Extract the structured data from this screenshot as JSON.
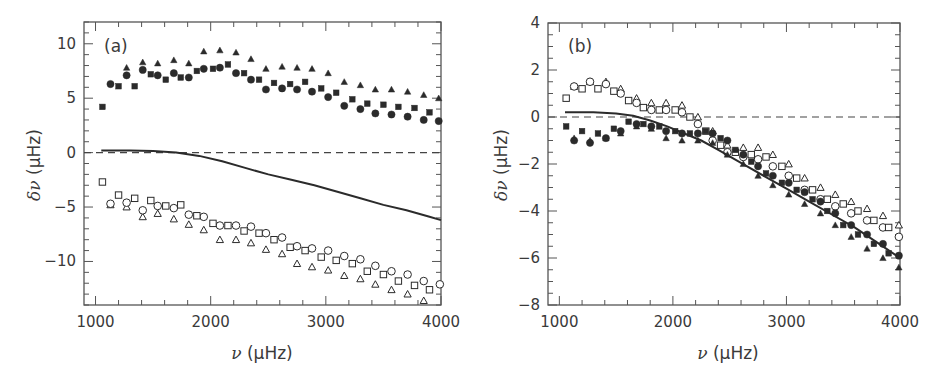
{
  "chart_data": [
    {
      "panel": "(a)",
      "type": "scatter",
      "xlabel": "ν (μHz)",
      "ylabel": "δν (μHz)",
      "xlim": [
        900,
        4000
      ],
      "ylim": [
        -14,
        12
      ],
      "xticks": [
        1000,
        2000,
        3000,
        4000
      ],
      "yticks": [
        -10,
        -5,
        0,
        5,
        10
      ],
      "grid": false,
      "reference_line": {
        "y": 0,
        "style": "dashed"
      },
      "series": [
        {
          "name": "filled triangles",
          "marker": "triangle-filled",
          "x": [
            1270,
            1410,
            1540,
            1680,
            1810,
            1940,
            2080,
            2220,
            2350,
            2480,
            2620,
            2750,
            2880,
            3020,
            3160,
            3300,
            3430,
            3570,
            3710,
            3850,
            3980
          ],
          "y": [
            7.8,
            8.3,
            8.2,
            8.5,
            8.2,
            9.3,
            9.4,
            9.2,
            8.6,
            7.7,
            7.9,
            7.8,
            7.7,
            7.3,
            6.5,
            6.2,
            5.8,
            5.8,
            5.6,
            5.3,
            5.0
          ]
        },
        {
          "name": "filled circles",
          "marker": "circle-filled",
          "x": [
            1130,
            1270,
            1410,
            1540,
            1680,
            1810,
            1940,
            2080,
            2220,
            2350,
            2480,
            2620,
            2750,
            2880,
            3020,
            3160,
            3300,
            3430,
            3570,
            3710,
            3850,
            3980
          ],
          "y": [
            6.3,
            7.1,
            7.6,
            7.1,
            7.3,
            6.9,
            7.7,
            7.8,
            7.3,
            6.7,
            5.8,
            5.9,
            5.8,
            5.6,
            5.1,
            4.3,
            4.0,
            3.6,
            3.5,
            3.3,
            3.0,
            2.9
          ]
        },
        {
          "name": "filled squares",
          "marker": "square-filled",
          "x": [
            1060,
            1200,
            1340,
            1480,
            1610,
            1740,
            1880,
            2020,
            2150,
            2290,
            2420,
            2550,
            2690,
            2820,
            2960,
            3090,
            3230,
            3360,
            3500,
            3630,
            3770,
            3900
          ],
          "y": [
            4.2,
            6.1,
            6.1,
            7.2,
            6.7,
            6.9,
            7.5,
            7.7,
            8.1,
            7.3,
            6.7,
            6.4,
            6.3,
            6.5,
            5.9,
            5.5,
            4.9,
            4.5,
            4.4,
            4.2,
            4.1,
            3.7
          ]
        },
        {
          "name": "open triangles",
          "marker": "triangle-open",
          "x": [
            1130,
            1270,
            1410,
            1540,
            1680,
            1810,
            1940,
            2080,
            2220,
            2350,
            2480,
            2620,
            2750,
            2880,
            3020,
            3160,
            3300,
            3430,
            3570,
            3710,
            3850
          ],
          "y": [
            -4.8,
            -5.0,
            -5.9,
            -5.6,
            -6.1,
            -6.6,
            -7.1,
            -8.0,
            -8.0,
            -8.3,
            -8.9,
            -9.3,
            -10.2,
            -10.5,
            -10.8,
            -11.3,
            -11.6,
            -12.1,
            -12.6,
            -13.0,
            -13.6
          ]
        },
        {
          "name": "open circles",
          "marker": "circle-open",
          "x": [
            1130,
            1270,
            1410,
            1540,
            1680,
            1810,
            1940,
            2080,
            2220,
            2350,
            2480,
            2620,
            2750,
            2880,
            3020,
            3160,
            3300,
            3430,
            3570,
            3710,
            3850,
            3990
          ],
          "y": [
            -4.7,
            -4.6,
            -5.3,
            -4.9,
            -5.1,
            -5.7,
            -5.9,
            -6.7,
            -6.7,
            -6.8,
            -7.4,
            -7.8,
            -8.6,
            -8.8,
            -9.0,
            -9.5,
            -9.8,
            -10.4,
            -10.9,
            -11.2,
            -11.8,
            -12.1
          ]
        },
        {
          "name": "open squares",
          "marker": "square-open",
          "x": [
            1060,
            1200,
            1340,
            1480,
            1610,
            1740,
            1880,
            2020,
            2150,
            2290,
            2420,
            2550,
            2690,
            2820,
            2960,
            3090,
            3230,
            3360,
            3500,
            3630,
            3770,
            3900
          ],
          "y": [
            -2.7,
            -3.9,
            -4.2,
            -4.4,
            -4.9,
            -4.8,
            -5.8,
            -6.5,
            -6.7,
            -7.2,
            -7.4,
            -8.0,
            -8.7,
            -9.0,
            -9.6,
            -9.9,
            -10.2,
            -10.9,
            -11.2,
            -11.8,
            -12.2,
            -12.6
          ]
        },
        {
          "name": "model curve",
          "marker": "line-solid",
          "x": [
            1050,
            1300,
            1500,
            1700,
            1900,
            2100,
            2300,
            2500,
            2700,
            2900,
            3100,
            3300,
            3500,
            3700,
            3900,
            4000
          ],
          "y": [
            0.2,
            0.2,
            0.15,
            0.0,
            -0.3,
            -0.8,
            -1.4,
            -2.0,
            -2.5,
            -3.0,
            -3.6,
            -4.2,
            -4.8,
            -5.3,
            -5.9,
            -6.2
          ]
        }
      ]
    },
    {
      "panel": "(b)",
      "type": "scatter",
      "xlabel": "ν (μHz)",
      "ylabel": "δν (μHz)",
      "xlim": [
        900,
        4000
      ],
      "ylim": [
        -8,
        4
      ],
      "xticks": [
        1000,
        2000,
        3000,
        4000
      ],
      "yticks": [
        -8,
        -6,
        -4,
        -2,
        0,
        2,
        4
      ],
      "grid": false,
      "reference_line": {
        "y": 0,
        "style": "dashed"
      },
      "series": [
        {
          "name": "open triangles",
          "marker": "triangle-open",
          "x": [
            1130,
            1270,
            1410,
            1540,
            1680,
            1810,
            1940,
            2080,
            2220,
            2350,
            2480,
            2620,
            2750,
            2880,
            3020,
            3160,
            3300,
            3430,
            3570,
            3710,
            3850,
            3990
          ],
          "y": [
            1.3,
            1.5,
            1.5,
            1.2,
            0.8,
            0.6,
            0.6,
            0.5,
            0.0,
            -0.6,
            -1.2,
            -1.3,
            -1.3,
            -1.6,
            -2.0,
            -2.6,
            -3.0,
            -3.3,
            -3.6,
            -3.9,
            -4.2,
            -4.6
          ]
        },
        {
          "name": "open circles",
          "marker": "circle-open",
          "x": [
            1130,
            1270,
            1410,
            1540,
            1680,
            1810,
            1940,
            2080,
            2220,
            2350,
            2480,
            2620,
            2750,
            2880,
            3020,
            3160,
            3300,
            3430,
            3570,
            3710,
            3850,
            3990
          ],
          "y": [
            1.3,
            1.5,
            1.4,
            1.0,
            0.6,
            0.3,
            0.3,
            0.2,
            -0.3,
            -1.0,
            -1.5,
            -1.7,
            -1.8,
            -2.1,
            -2.5,
            -3.1,
            -3.5,
            -3.8,
            -4.1,
            -4.4,
            -4.7,
            -5.1
          ]
        },
        {
          "name": "open squares",
          "marker": "square-open",
          "x": [
            1060,
            1200,
            1340,
            1480,
            1610,
            1740,
            1880,
            2020,
            2150,
            2290,
            2420,
            2550,
            2690,
            2820,
            2960,
            3090,
            3230,
            3360,
            3500,
            3630,
            3770,
            3900
          ],
          "y": [
            0.8,
            1.2,
            1.2,
            1.1,
            0.7,
            0.4,
            0.3,
            0.3,
            0.0,
            -0.6,
            -1.2,
            -1.5,
            -1.6,
            -1.7,
            -2.1,
            -2.6,
            -3.1,
            -3.5,
            -3.7,
            -4.0,
            -4.4,
            -4.7
          ]
        },
        {
          "name": "filled circles",
          "marker": "circle-filled",
          "x": [
            1130,
            1270,
            1410,
            1540,
            1680,
            1810,
            1940,
            2080,
            2220,
            2350,
            2480,
            2620,
            2750,
            2880,
            3020,
            3160,
            3300,
            3430,
            3570,
            3710,
            3850,
            3990
          ],
          "y": [
            -1.0,
            -1.1,
            -0.9,
            -0.6,
            -0.3,
            -0.4,
            -0.6,
            -0.7,
            -0.7,
            -0.7,
            -1.0,
            -1.6,
            -2.1,
            -2.5,
            -2.8,
            -3.2,
            -3.6,
            -4.1,
            -4.6,
            -5.0,
            -5.4,
            -5.9
          ]
        },
        {
          "name": "filled squares",
          "marker": "square-filled",
          "x": [
            1060,
            1200,
            1340,
            1480,
            1610,
            1740,
            1880,
            2020,
            2150,
            2290,
            2420,
            2550,
            2690,
            2820,
            2960,
            3090,
            3230,
            3360,
            3500,
            3630,
            3770,
            3900
          ],
          "y": [
            -0.4,
            -0.6,
            -0.7,
            -0.5,
            -0.2,
            -0.3,
            -0.4,
            -0.6,
            -0.7,
            -0.6,
            -0.9,
            -1.4,
            -1.9,
            -2.4,
            -2.8,
            -3.1,
            -3.5,
            -4.0,
            -4.6,
            -5.0,
            -5.4,
            -5.8
          ]
        },
        {
          "name": "filled triangles",
          "marker": "triangle-filled",
          "x": [
            1130,
            1270,
            1410,
            1540,
            1680,
            1810,
            1940,
            2080,
            2220,
            2350,
            2480,
            2620,
            2750,
            2880,
            3020,
            3160,
            3300,
            3430,
            3570,
            3710,
            3850,
            3990
          ],
          "y": [
            -0.9,
            -1.0,
            -0.9,
            -0.7,
            -0.4,
            -0.5,
            -0.9,
            -1.0,
            -1.0,
            -1.1,
            -1.6,
            -2.0,
            -2.5,
            -2.9,
            -3.3,
            -3.7,
            -4.1,
            -4.6,
            -5.1,
            -5.6,
            -6.0,
            -6.4
          ]
        },
        {
          "name": "model curve",
          "marker": "line-solid",
          "x": [
            1050,
            1300,
            1500,
            1650,
            1800,
            1950,
            2100,
            2250,
            2400,
            2600,
            2800,
            3000,
            3200,
            3400,
            3600,
            3800,
            4000
          ],
          "y": [
            0.2,
            0.2,
            0.15,
            0.05,
            -0.15,
            -0.4,
            -0.7,
            -1.0,
            -1.4,
            -1.95,
            -2.5,
            -3.05,
            -3.6,
            -4.15,
            -4.7,
            -5.35,
            -6.0
          ]
        }
      ]
    }
  ],
  "panels": [
    {
      "label": "(a)",
      "ylabel_symbol": "δν",
      "ylabel_unit": " (μHz)",
      "xlabel_symbol": "ν",
      "xlabel_unit": " (μHz)",
      "xtick_labels": [
        "1000",
        "2000",
        "3000",
        "4000"
      ],
      "ytick_labels": [
        "−10",
        "−5",
        "0",
        "5",
        "10"
      ]
    },
    {
      "label": "(b)",
      "ylabel_symbol": "δν",
      "ylabel_unit": " (μHz)",
      "xlabel_symbol": "ν",
      "xlabel_unit": " (μHz)",
      "xtick_labels": [
        "1000",
        "2000",
        "3000",
        "4000"
      ],
      "ytick_labels": [
        "−8",
        "−6",
        "−4",
        "−2",
        "0",
        "2",
        "4"
      ]
    }
  ],
  "colors": {
    "ink": "#2b2b2b",
    "frame": "#555555",
    "text": "#3a3a3a",
    "background": "#ffffff"
  }
}
